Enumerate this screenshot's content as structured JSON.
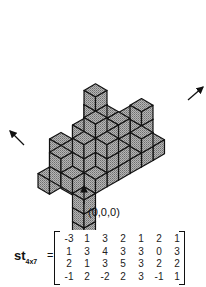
{
  "figure": {
    "origin_label": "(0,0,0)",
    "colors": {
      "cube_fill": "#a6a6a6",
      "edge": "#111111",
      "background": "#ffffff"
    }
  },
  "matrix": {
    "name": "st",
    "subscript": "4x7",
    "equals": "=",
    "rows": [
      [
        "-3",
        "1",
        "3",
        "2",
        "1",
        "2",
        "1"
      ],
      [
        "1",
        "3",
        "4",
        "3",
        "3",
        "0",
        "3"
      ],
      [
        "2",
        "1",
        "3",
        "5",
        "3",
        "2",
        "2"
      ],
      [
        "-1",
        "2",
        "-2",
        "2",
        "3",
        "-1",
        "1"
      ]
    ]
  }
}
